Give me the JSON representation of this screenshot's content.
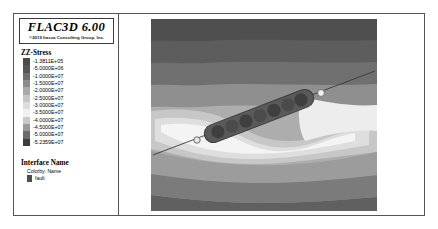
{
  "window": {
    "app_title": "FLAC3D 6.00",
    "copyright": "©2019 Itasca Consulting Group, Inc."
  },
  "legend": {
    "heading": "ZZ-Stress",
    "ticks": [
      "-1.3811E+05",
      "-5.0000E+06",
      "-1.0000E+07",
      "-1.5000E+07",
      "-2.0000E+07",
      "-2.5000E+07",
      "-3.0000E+07",
      "-3.5000E+07",
      "-4.0000E+07",
      "-4.5000E+07",
      "-5.0000E+07",
      "-5.2359E+07"
    ],
    "colors": [
      "#4a4a4a",
      "#565656",
      "#6e6e6e",
      "#8c8c8c",
      "#ababab",
      "#c6c6c6",
      "#dddddd",
      "#f0f0f0",
      "#c9c9c9",
      "#9a9a9a",
      "#6a6a6a",
      "#3c3c3c"
    ]
  },
  "interface": {
    "heading": "Interface Name",
    "colorby": "Colorby: Name",
    "items": [
      {
        "label": "fault",
        "color": "#4d4d4d"
      }
    ]
  },
  "chart_data": {
    "type": "heatmap",
    "title": "ZZ-Stress",
    "subtitle": "FLAC3D 6.00 contour plot",
    "xlabel": "",
    "ylabel": "",
    "grid": false,
    "legend_position": "left",
    "colormap": "grayscale",
    "value_range": [
      -52359000,
      -138110
    ],
    "units": "Pa",
    "contour_levels": [
      -138110,
      -5000000,
      -10000000,
      -15000000,
      -20000000,
      -25000000,
      -30000000,
      -35000000,
      -40000000,
      -45000000,
      -50000000,
      -52359000
    ],
    "bands": [
      {
        "name": "band-top-dark",
        "level": -50000000,
        "color": "#4f4f4f"
      },
      {
        "name": "band-upper-dark",
        "level": -45000000,
        "color": "#5d5d5d"
      },
      {
        "name": "band-upper-mid",
        "level": -40000000,
        "color": "#707070"
      },
      {
        "name": "band-mid",
        "level": -32000000,
        "color": "#8f8f8f"
      },
      {
        "name": "band-mid-light",
        "level": -24000000,
        "color": "#adadad"
      },
      {
        "name": "band-light",
        "level": -16000000,
        "color": "#c7c7c7"
      },
      {
        "name": "band-lighter",
        "level": -9000000,
        "color": "#dedede"
      },
      {
        "name": "band-lobe-core",
        "level": -138110,
        "color": "#f4f4f4"
      },
      {
        "name": "band-lower-mid",
        "level": -30000000,
        "color": "#9c9c9c"
      },
      {
        "name": "band-lower-dark",
        "level": -42000000,
        "color": "#7b7b7b"
      },
      {
        "name": "band-bottom",
        "level": -52359000,
        "color": "#606060"
      }
    ],
    "features": [
      {
        "name": "fault-trace",
        "type": "line",
        "color": "#3f3f3f",
        "description": "Thin inclined fault trace running lower-left to upper-right across the model"
      },
      {
        "name": "reinforcement-elements",
        "type": "segmented-bar",
        "color": "#4a4a4a",
        "count": 7,
        "description": "Elongated inclined dark body composed of rounded segments, centered on the fault"
      }
    ]
  }
}
